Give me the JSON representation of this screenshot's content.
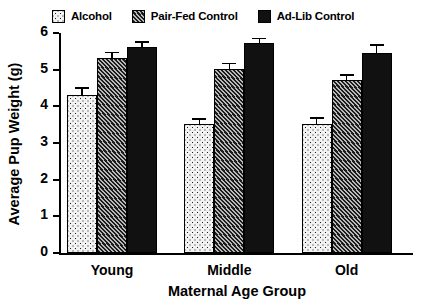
{
  "chart_data": {
    "type": "bar",
    "title": "",
    "xlabel": "Maternal Age Group",
    "ylabel": "Average Pup Weight  (g)",
    "ylim": [
      0,
      6
    ],
    "yticks": [
      0,
      1,
      2,
      3,
      4,
      5,
      6
    ],
    "ytick_labels": [
      "0",
      "1",
      "2",
      "3",
      "4",
      "5",
      "6"
    ],
    "grid": false,
    "legend_position": "top",
    "categories": [
      "Young",
      "Middle",
      "Old"
    ],
    "series": [
      {
        "name": "Alcohol",
        "pattern": "dotted",
        "values": [
          4.3,
          3.52,
          3.53
        ],
        "errors": [
          0.18,
          0.12,
          0.13
        ]
      },
      {
        "name": "Pair-Fed Control",
        "pattern": "hatched",
        "values": [
          5.31,
          5.03,
          4.73
        ],
        "errors": [
          0.14,
          0.12,
          0.11
        ]
      },
      {
        "name": "Ad-Lib Control",
        "pattern": "solid",
        "values": [
          5.61,
          5.73,
          5.45
        ],
        "errors": [
          0.13,
          0.1,
          0.2
        ]
      }
    ]
  },
  "legend": {
    "entries": [
      {
        "label": "Alcohol",
        "swatch": "dotted-swatch-icon"
      },
      {
        "label": "Pair-Fed Control",
        "swatch": "hatched-swatch-icon"
      },
      {
        "label": "Ad-Lib Control",
        "swatch": "solid-swatch-icon"
      }
    ]
  },
  "colors": {
    "axis": "#000000",
    "bar_solid": "#111111",
    "bar_hatch_dark": "#1c1c1c",
    "bar_hatch_light": "#b9b9b9",
    "bar_dot_bg": "#f2f2f2",
    "bar_dot_fg": "#1a1a1a",
    "background": "#ffffff"
  }
}
